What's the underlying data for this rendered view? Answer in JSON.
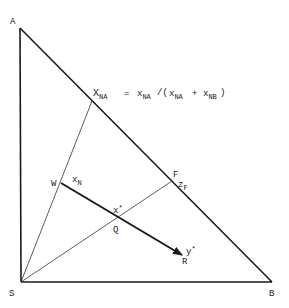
{
  "diagram": {
    "type": "ternary-triangle-construction",
    "vertices": {
      "A": {
        "label": "A",
        "x": 20,
        "y": 28
      },
      "S": {
        "label": "S",
        "x": 21,
        "y": 282
      },
      "B": {
        "label": "B",
        "x": 272,
        "y": 282
      }
    },
    "points": {
      "XNA": {
        "label_main": "X",
        "label_sub": "NA",
        "x": 92,
        "y": 101
      },
      "F": {
        "label": "F",
        "x": 172,
        "y": 181
      },
      "W": {
        "label": "W",
        "x": 61,
        "y": 183
      },
      "Q": {
        "label": "Q",
        "x": 117,
        "y": 218
      },
      "R": {
        "label": "R",
        "x": 182,
        "y": 256
      }
    },
    "labels": {
      "A": "A",
      "S": "S",
      "B": "B",
      "F": "F",
      "W": "W",
      "Q": "Q",
      "R": "R",
      "xN_main": "x",
      "xN_sub": "N",
      "xstar_main": "x",
      "xstar_sup": "*",
      "zF_main": "z",
      "zF_sub": "F",
      "ystar_main": "y",
      "ystar_sup": "*",
      "formula": {
        "lhs_main": "X",
        "lhs_sub": "NA",
        "eq": "=",
        "t1_main": "x",
        "t1_sub": "NA",
        "slash_paren": "/(",
        "t2_main": "x",
        "t2_sub": "NA",
        "plus": "+",
        "t3_main": "x",
        "t3_sub": "NB",
        "close": ")"
      }
    },
    "colors": {
      "line": "#1a1a1a",
      "thin_line": "#333333",
      "background": "#ffffff"
    }
  }
}
